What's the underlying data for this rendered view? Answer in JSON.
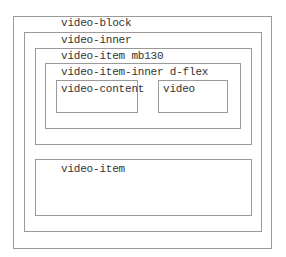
{
  "diagram": {
    "video_block": {
      "label": "video-block"
    },
    "video_inner": {
      "label": "video-inner"
    },
    "video_item_1": {
      "label": "video-item mb130"
    },
    "video_item_inner": {
      "label": "video-item-inner d-flex"
    },
    "video_content": {
      "label": "video-content"
    },
    "video": {
      "label": "video"
    },
    "video_item_2": {
      "label": "video-item"
    }
  }
}
